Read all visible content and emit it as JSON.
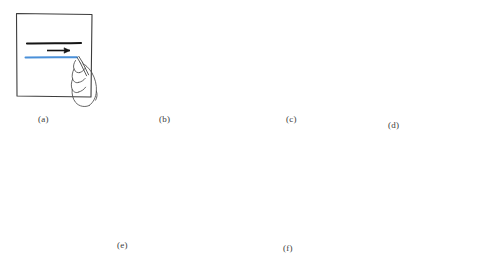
{
  "figure": {
    "kind": "line-drawing-illustration",
    "background_color": "#ffffff",
    "ink_color": "#1a1a1a",
    "highlight_color": "#4a90d9",
    "paper_outline_color": "#3c3c3c",
    "hand_outline_color": "#4a4a4a"
  },
  "panels": [
    {
      "id": "a",
      "caption": "(a)",
      "caption_x": 38,
      "caption_y": 114,
      "paper_shape": "square",
      "stroke_direction": "horizontal",
      "arrow_direction": "right",
      "hand_count": 1,
      "black_strokes": 1,
      "blue_strokes": 1
    },
    {
      "id": "b",
      "caption": "(b)",
      "caption_x": 159,
      "caption_y": 114,
      "paper_shape": "square",
      "stroke_direction": "vertical",
      "arrow_direction": "down",
      "hand_count": 1,
      "black_strokes": 1,
      "blue_strokes": 1
    },
    {
      "id": "c",
      "caption": "(c)",
      "caption_x": 286,
      "caption_y": 114,
      "paper_shape": "square",
      "stroke_direction": "diagonal-down-right",
      "arrow_direction": "down-right",
      "hand_count": 1,
      "black_strokes": 3,
      "blue_strokes": 1
    },
    {
      "id": "d",
      "caption": "(d)",
      "caption_x": 388,
      "caption_y": 120,
      "paper_shape": "square",
      "stroke_direction": "diagonal-down-left",
      "arrow_direction": "down-left",
      "hand_count": 1,
      "black_strokes": 3,
      "blue_strokes": 1
    },
    {
      "id": "e",
      "caption": "(e)",
      "caption_x": 117,
      "caption_y": 245,
      "paper_shape": "tilted-quadrilateral",
      "stroke_direction": "horizontal",
      "arrow_direction": "right",
      "hand_count": 2,
      "black_strokes": 2,
      "blue_strokes": 1
    },
    {
      "id": "f",
      "caption": "(f)",
      "caption_x": 297,
      "caption_y": 247,
      "paper_shape": "tilted-quadrilateral",
      "stroke_direction": "vertical",
      "arrow_direction": "down",
      "hand_count": 2,
      "black_strokes": 2,
      "blue_strokes": 1
    }
  ]
}
